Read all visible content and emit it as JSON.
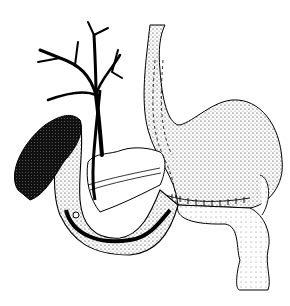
{
  "image": {
    "kind": "medical line illustration",
    "width": 290,
    "height": 306,
    "background": "#ffffff",
    "ink": "#000000",
    "structures": [
      "biliary-tree",
      "gallbladder",
      "esophagus",
      "stomach",
      "duodenum-loop",
      "pancreas",
      "stent-catheter",
      "jejunum",
      "suture-line"
    ]
  }
}
